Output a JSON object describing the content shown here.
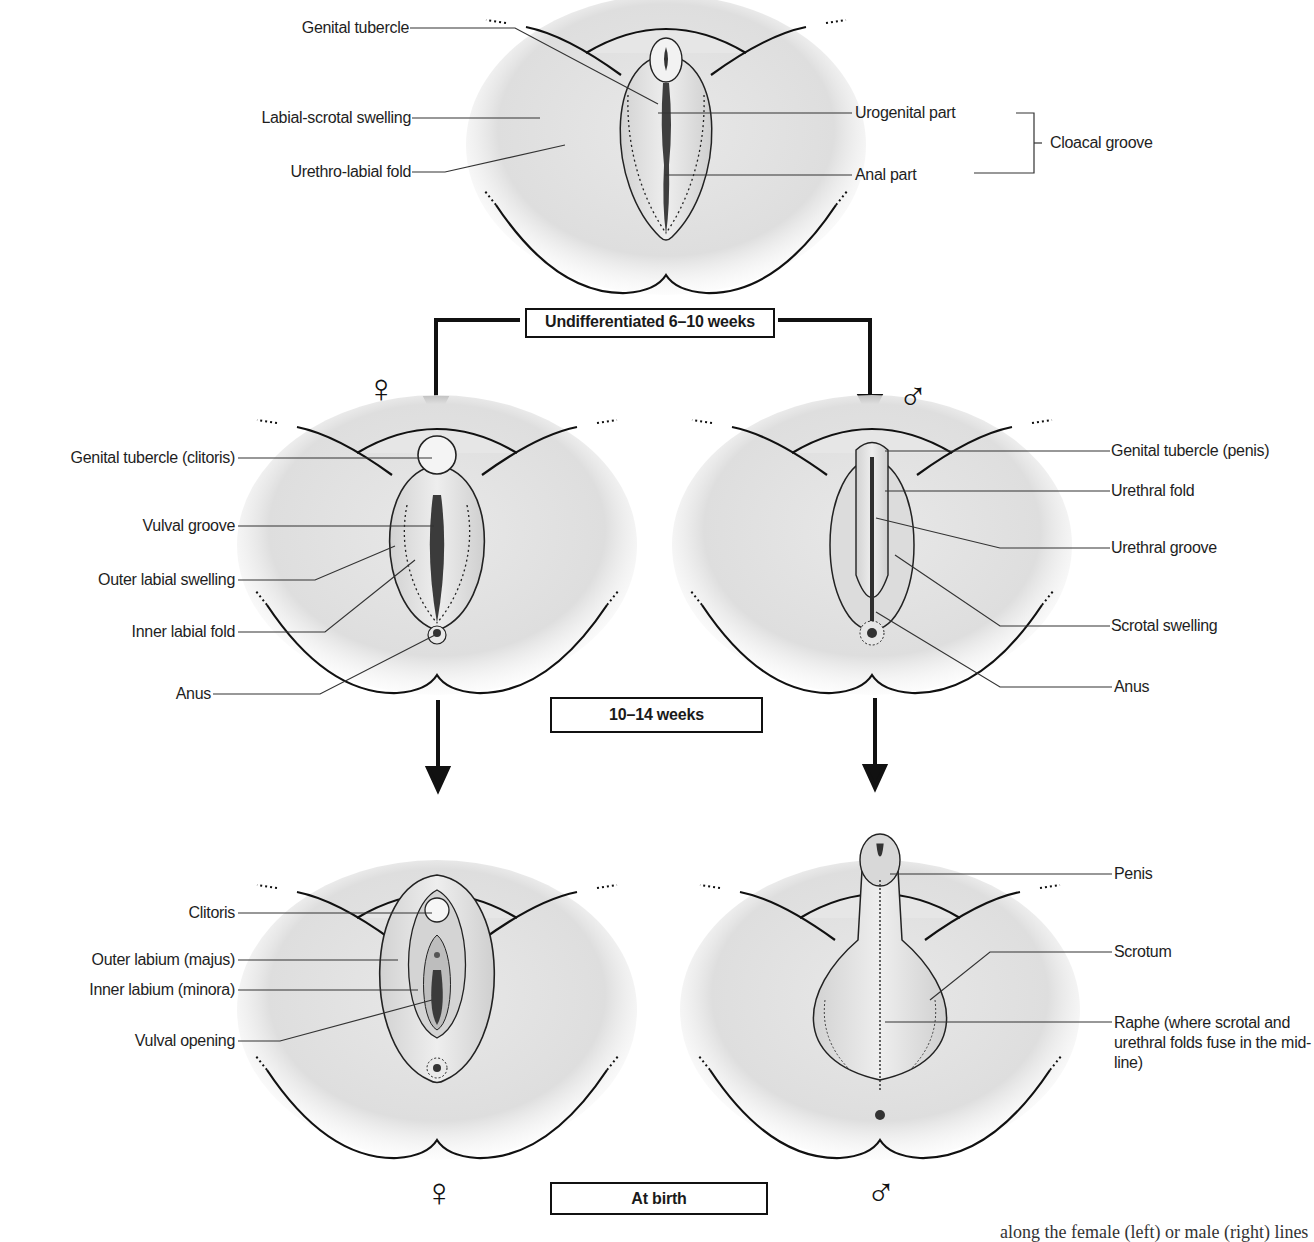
{
  "figure": {
    "stages": {
      "undifferentiated": "Undifferentiated 6–10 weeks",
      "mid": "10–14 weeks",
      "birth": "At birth"
    },
    "symbols": {
      "female": "♀",
      "male": "♂"
    },
    "colors": {
      "skin_fill": "#e3e3e3",
      "skin_shadow": "#c8c8c8",
      "outline": "#111111",
      "groove": "#444444",
      "label_line": "#333333"
    }
  },
  "panels": {
    "undifferentiated": {
      "labels_left": [
        "Genital tubercle",
        "Labial-scrotal swelling",
        "Urethro-labial fold"
      ],
      "labels_right": [
        "Urogenital part",
        "Anal part"
      ],
      "bracket_label": "Cloacal groove"
    },
    "female_10_14": {
      "labels": [
        "Genital tubercle (clitoris)",
        "Vulval groove",
        "Outer labial swelling",
        "Inner labial fold",
        "Anus"
      ]
    },
    "male_10_14": {
      "labels": [
        "Genital tubercle (penis)",
        "Urethral fold",
        "Urethral groove",
        "Scrotal swelling",
        "Anus"
      ]
    },
    "female_birth": {
      "labels": [
        "Clitoris",
        "Outer labium (majus)",
        "Inner labium (minora)",
        "Vulval opening"
      ]
    },
    "male_birth": {
      "labels": [
        "Penis",
        "Scrotum",
        "Raphe (where scrotal and urethral folds fuse in the mid-line)"
      ]
    }
  },
  "caption_fragment": "along the female (left) or male (right) lines"
}
